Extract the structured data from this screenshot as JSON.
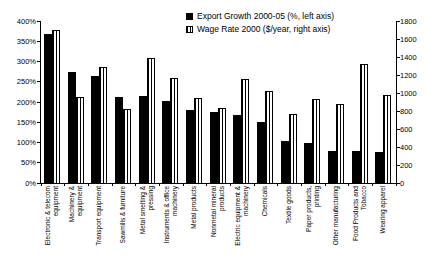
{
  "chart_data": {
    "type": "bar",
    "title": "",
    "grid": false,
    "legend_position": "top-right",
    "background_color": "#ffffff",
    "bar_color_solid": "#000000",
    "bar_pattern_striped": "vertical black stripes on white",
    "categories": [
      "Electronic & telecom equipment",
      "Machinery & equipment",
      "Transport equipment",
      "Sawmills & furniture",
      "Metal smelting & pressing",
      "Instruments & office machinery",
      "Metal products",
      "Nonmetal mineral products",
      "Electric equipment & machinery",
      "Chemicals",
      "Textile goods",
      "Paper products, printing",
      "Other manufacturing",
      "Food Products and Tobacco",
      "Wearing apparel"
    ],
    "series": [
      {
        "name": "Export Growth 2000-05 (%, left axis)",
        "axis": "left",
        "style": "solid",
        "values": [
          368,
          274,
          264,
          213,
          214,
          202,
          181,
          175,
          168,
          150,
          104,
          100,
          80,
          78,
          77
        ]
      },
      {
        "name": "Wage Rate 2000 ($/year, right axis)",
        "axis": "right",
        "style": "striped",
        "values": [
          1700,
          960,
          1290,
          825,
          1390,
          1170,
          950,
          835,
          1160,
          1020,
          770,
          930,
          880,
          1320,
          975
        ]
      }
    ],
    "left_axis": {
      "min": 0,
      "max": 400,
      "step": 50,
      "unit": "%",
      "tick_labels": [
        "0%",
        "50%",
        "100%",
        "150%",
        "200%",
        "250%",
        "300%",
        "350%",
        "400%"
      ]
    },
    "right_axis": {
      "min": 0,
      "max": 1800,
      "step": 200,
      "tick_labels": [
        "0",
        "200",
        "400",
        "600",
        "800",
        "1000",
        "1200",
        "1400",
        "1600",
        "1800"
      ]
    }
  }
}
